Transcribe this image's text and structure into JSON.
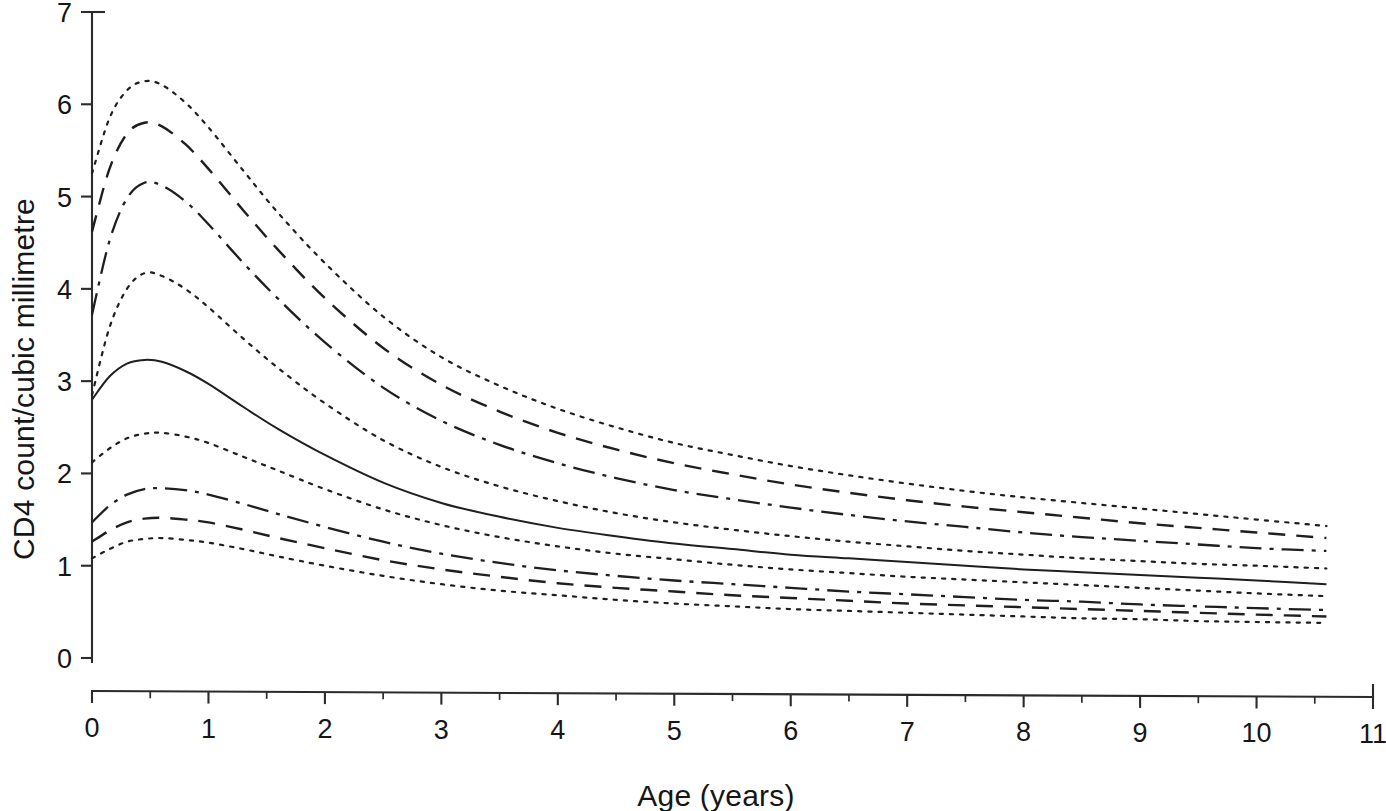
{
  "figure": {
    "name": "cd4-count-centile-chart",
    "background": "#ffffff",
    "ink_color": "#1f1f1f"
  },
  "chart_data": {
    "type": "line",
    "title": "",
    "subtitle": "",
    "xlabel": "Age (years)",
    "ylabel": "CD4 count/cubic millimetre",
    "xlim": [
      0,
      11
    ],
    "ylim": [
      0,
      7
    ],
    "grid": false,
    "legend": "none",
    "x_ticks": [
      0,
      1,
      2,
      3,
      4,
      5,
      6,
      7,
      8,
      9,
      10,
      11
    ],
    "x_tick_labels": [
      "0",
      "1",
      "2",
      "3",
      "4",
      "5",
      "6",
      "7",
      "8",
      "9",
      "10",
      "11"
    ],
    "x_minor_tick_interval": 0.5,
    "y_ticks": [
      0,
      1,
      2,
      3,
      4,
      5,
      6,
      7
    ],
    "y_tick_labels": [
      "0",
      "1",
      "2",
      "3",
      "4",
      "5",
      "6",
      "7"
    ],
    "x_data_range": [
      0,
      10.6
    ],
    "x": [
      0,
      0.15,
      0.3,
      0.45,
      0.6,
      0.8,
      1.0,
      1.3,
      1.6,
      2.0,
      2.5,
      3.0,
      3.5,
      4.0,
      4.5,
      5.0,
      5.5,
      6.0,
      6.5,
      7.0,
      7.5,
      8.0,
      8.5,
      9.0,
      9.5,
      10.0,
      10.6
    ],
    "series": [
      {
        "name": "centile-97",
        "style": "dotted",
        "peak_value": 6.25,
        "peak_age": 0.45,
        "values": [
          5.25,
          5.85,
          6.15,
          6.25,
          6.21,
          6.02,
          5.75,
          5.28,
          4.82,
          4.28,
          3.7,
          3.26,
          2.95,
          2.7,
          2.5,
          2.33,
          2.2,
          2.08,
          1.98,
          1.89,
          1.81,
          1.74,
          1.68,
          1.62,
          1.56,
          1.5,
          1.43
        ]
      },
      {
        "name": "centile-90",
        "style": "dashed",
        "peak_value": 5.8,
        "peak_age": 0.45,
        "values": [
          4.62,
          5.3,
          5.68,
          5.8,
          5.76,
          5.57,
          5.3,
          4.85,
          4.42,
          3.9,
          3.36,
          2.96,
          2.67,
          2.44,
          2.26,
          2.11,
          1.99,
          1.88,
          1.79,
          1.71,
          1.64,
          1.58,
          1.52,
          1.46,
          1.41,
          1.36,
          1.3
        ]
      },
      {
        "name": "centile-75",
        "style": "dashdot",
        "peak_value": 5.15,
        "peak_age": 0.45,
        "values": [
          3.72,
          4.52,
          4.98,
          5.15,
          5.12,
          4.95,
          4.7,
          4.28,
          3.89,
          3.42,
          2.93,
          2.57,
          2.31,
          2.11,
          1.95,
          1.82,
          1.72,
          1.63,
          1.55,
          1.48,
          1.42,
          1.36,
          1.31,
          1.27,
          1.23,
          1.19,
          1.16
        ]
      },
      {
        "name": "centile-50-upper-band",
        "style": "dotted",
        "peak_value": 4.17,
        "peak_age": 0.45,
        "values": [
          2.85,
          3.58,
          4.0,
          4.17,
          4.14,
          4.0,
          3.8,
          3.46,
          3.14,
          2.76,
          2.36,
          2.07,
          1.86,
          1.7,
          1.57,
          1.47,
          1.39,
          1.32,
          1.26,
          1.21,
          1.16,
          1.12,
          1.08,
          1.05,
          1.02,
          1.0,
          0.97
        ]
      },
      {
        "name": "median",
        "style": "solid",
        "peak_value": 3.23,
        "peak_age": 0.45,
        "values": [
          2.8,
          3.05,
          3.19,
          3.23,
          3.21,
          3.11,
          2.97,
          2.72,
          2.48,
          2.2,
          1.9,
          1.68,
          1.53,
          1.41,
          1.32,
          1.24,
          1.18,
          1.12,
          1.08,
          1.04,
          1.0,
          0.96,
          0.93,
          0.9,
          0.87,
          0.84,
          0.8
        ]
      },
      {
        "name": "centile-50-lower-band",
        "style": "dotted",
        "peak_value": 2.44,
        "peak_age": 0.5,
        "values": [
          2.12,
          2.27,
          2.38,
          2.43,
          2.44,
          2.4,
          2.33,
          2.18,
          2.03,
          1.83,
          1.61,
          1.44,
          1.31,
          1.21,
          1.13,
          1.07,
          1.01,
          0.96,
          0.92,
          0.88,
          0.85,
          0.82,
          0.79,
          0.76,
          0.73,
          0.7,
          0.67
        ]
      },
      {
        "name": "centile-25",
        "style": "dashdot",
        "peak_value": 1.84,
        "peak_age": 0.5,
        "values": [
          1.47,
          1.65,
          1.77,
          1.83,
          1.84,
          1.82,
          1.77,
          1.67,
          1.56,
          1.42,
          1.26,
          1.13,
          1.03,
          0.95,
          0.89,
          0.84,
          0.8,
          0.76,
          0.72,
          0.69,
          0.66,
          0.63,
          0.61,
          0.58,
          0.56,
          0.54,
          0.52
        ]
      },
      {
        "name": "centile-10",
        "style": "dashed",
        "peak_value": 1.52,
        "peak_age": 0.5,
        "values": [
          1.26,
          1.38,
          1.47,
          1.51,
          1.52,
          1.5,
          1.47,
          1.39,
          1.3,
          1.19,
          1.06,
          0.96,
          0.88,
          0.81,
          0.76,
          0.72,
          0.68,
          0.65,
          0.62,
          0.59,
          0.57,
          0.55,
          0.53,
          0.51,
          0.49,
          0.47,
          0.45
        ]
      },
      {
        "name": "centile-3",
        "style": "dotted",
        "peak_value": 1.3,
        "peak_age": 0.5,
        "values": [
          1.08,
          1.18,
          1.26,
          1.29,
          1.3,
          1.28,
          1.25,
          1.18,
          1.1,
          1.0,
          0.89,
          0.8,
          0.73,
          0.68,
          0.63,
          0.59,
          0.56,
          0.53,
          0.51,
          0.49,
          0.47,
          0.45,
          0.43,
          0.42,
          0.4,
          0.39,
          0.38
        ]
      }
    ]
  }
}
